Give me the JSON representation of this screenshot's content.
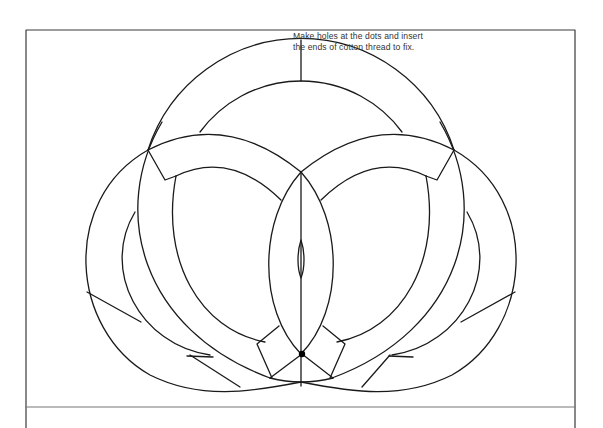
{
  "instructions": {
    "line1": "Make holes at the dots and insert",
    "line2": "the ends of cotton thread to fix."
  },
  "colors": {
    "stroke": "#1a1a1a",
    "background": "#ffffff",
    "frame": "#3a3a3a"
  },
  "diagram": {
    "type": "interlocking-rings-template",
    "frame": {
      "x": 26,
      "y": 30,
      "width": 549,
      "height": 398
    },
    "divider_y": 407,
    "fix_dot": {
      "x": 302,
      "y": 354
    }
  }
}
